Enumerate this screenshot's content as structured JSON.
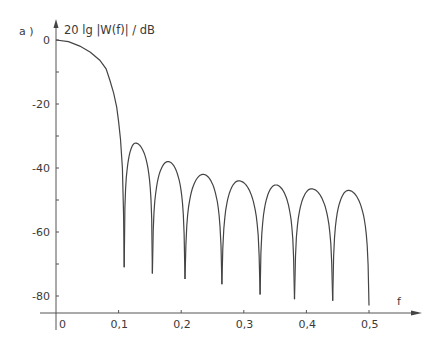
{
  "chart_data": {
    "type": "line",
    "panel_label": "a )",
    "title": "",
    "ylabel": "20 lg |W(f)| / dB",
    "xlabel": "f",
    "xlim": [
      0,
      0.55
    ],
    "ylim": [
      -85,
      0
    ],
    "grid": false,
    "legend": "none",
    "x_ticks": [
      0,
      0.1,
      0.2,
      0.3,
      0.4,
      0.5
    ],
    "x_tick_labels": [
      "0",
      "0,1",
      "0,2",
      "0,3",
      "0,4",
      "0,5"
    ],
    "y_ticks": [
      0,
      -20,
      -40,
      -60,
      -80
    ],
    "y_tick_labels": [
      "0",
      "-20",
      "-40",
      "-60",
      "-80"
    ],
    "y_minor_ticks": [
      -10,
      -30,
      -50,
      -70
    ],
    "series": [
      {
        "name": "20 lg |W(f)|",
        "main_lobe": [
          [
            0,
            0
          ],
          [
            0.02,
            -0.5
          ],
          [
            0.038,
            -1.9
          ],
          [
            0.055,
            -3.8
          ],
          [
            0.07,
            -6.3
          ],
          [
            0.08,
            -9
          ],
          [
            0.086,
            -12.5
          ],
          [
            0.092,
            -16.5
          ],
          [
            0.097,
            -21
          ],
          [
            0.1,
            -25.5
          ],
          [
            0.103,
            -31
          ],
          [
            0.106,
            -40
          ],
          [
            0.108,
            -55
          ],
          [
            0.109,
            -71
          ]
        ],
        "nulls": [
          {
            "f": 0.109,
            "db": -71
          },
          {
            "f": 0.154,
            "db": -73
          },
          {
            "f": 0.206,
            "db": -74.7
          },
          {
            "f": 0.265,
            "db": -76.3
          },
          {
            "f": 0.326,
            "db": -79.5
          },
          {
            "f": 0.381,
            "db": -81
          },
          {
            "f": 0.442,
            "db": -81.5
          },
          {
            "f": 0.5,
            "db": -83
          }
        ],
        "side_lobe_peaks": [
          {
            "f": 0.127,
            "db": -32.2
          },
          {
            "f": 0.179,
            "db": -38
          },
          {
            "f": 0.235,
            "db": -42
          },
          {
            "f": 0.292,
            "db": -44
          },
          {
            "f": 0.351,
            "db": -45.3
          },
          {
            "f": 0.408,
            "db": -46.5
          },
          {
            "f": 0.467,
            "db": -47
          }
        ]
      }
    ]
  }
}
